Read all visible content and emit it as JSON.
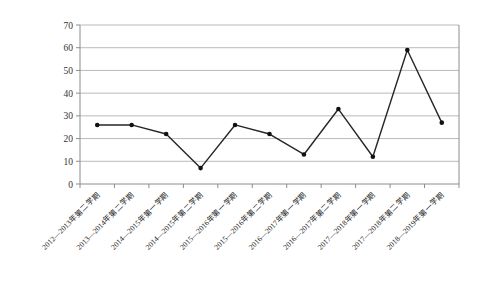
{
  "chart_data": {
    "type": "line",
    "title": "",
    "xlabel": "",
    "ylabel": "",
    "categories": [
      "2012—2013年第二学期",
      "2013—2014年第二学期",
      "2014—2015年第一学期",
      "2014—2015年第二学期",
      "2015—2016年第一学期",
      "2015—2016年第二学期",
      "2016—2017年第一学期",
      "2016—2017年第二学期",
      "2017—2018年第一学期",
      "2017—2018年第二学期",
      "2018—2019年第一学期"
    ],
    "values": [
      26,
      26,
      22,
      7,
      26,
      22,
      13,
      33,
      12,
      59,
      27
    ],
    "ylim": [
      0,
      70
    ],
    "yticks": [
      0,
      10,
      20,
      30,
      40,
      50,
      60,
      70
    ],
    "grid": true,
    "legend": "none",
    "x_label_rotation_deg": -45,
    "colors": {
      "series_line": "#262626",
      "marker": "#111111",
      "gridline": "#bababa",
      "axis": "#8c8c8c",
      "tick_label": "#333333",
      "background": "#ffffff"
    }
  }
}
